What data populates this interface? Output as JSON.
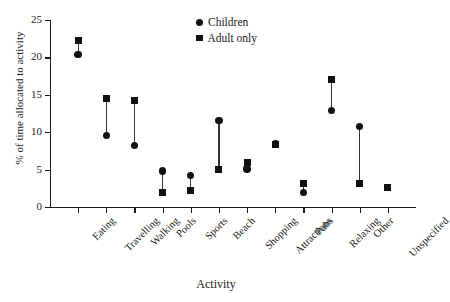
{
  "chart_data": {
    "type": "scatter",
    "title": "",
    "xlabel": "Activity",
    "ylabel": "% of time allocated to activity",
    "ylim": [
      0,
      25
    ],
    "yticks": [
      0,
      5,
      10,
      15,
      20,
      25
    ],
    "grid": false,
    "legend_position": "top-center-right",
    "categories": [
      "Eating",
      "Travelling",
      "Walking",
      "Pools",
      "Sports",
      "Beach",
      "Shopping",
      "Attractions",
      "Pubs",
      "Relaxing",
      "Other",
      "Unspecified"
    ],
    "series": [
      {
        "name": "Children",
        "marker": "circle",
        "values": [
          20.4,
          9.6,
          8.2,
          4.8,
          4.2,
          11.6,
          5.1,
          8.4,
          1.9,
          12.9,
          10.8,
          null
        ]
      },
      {
        "name": "Adult only",
        "marker": "square",
        "values": [
          22.2,
          14.5,
          14.2,
          2.0,
          2.2,
          5.0,
          6.0,
          8.4,
          3.1,
          17.0,
          3.1,
          2.6
        ]
      }
    ]
  },
  "legend": {
    "entries": [
      {
        "label": "Children",
        "marker": "circle"
      },
      {
        "label": "Adult only",
        "marker": "square"
      }
    ]
  },
  "colors": {
    "marker": "#111111",
    "axis": "#1a1a1a",
    "background": "#ffffff"
  }
}
